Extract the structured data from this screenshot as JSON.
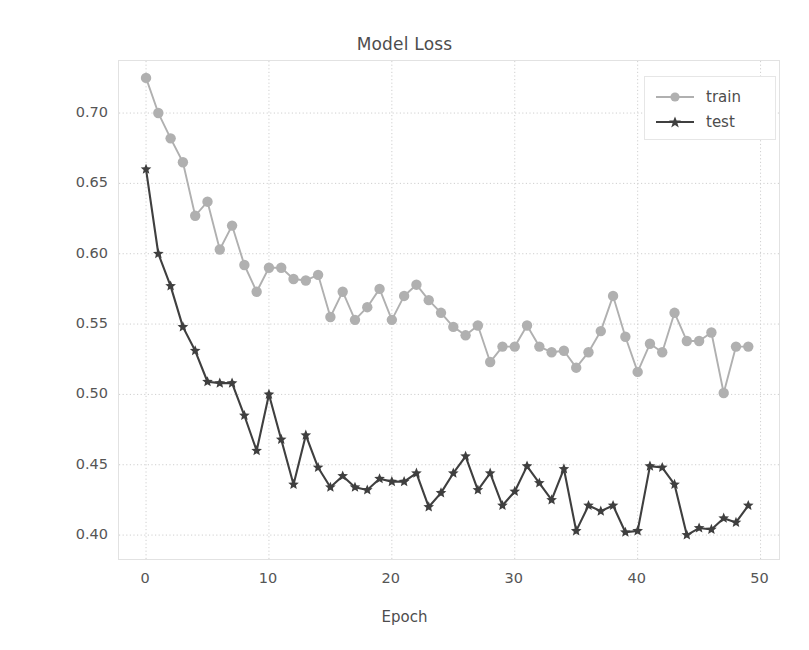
{
  "chart_data": {
    "type": "line",
    "title": "Model Loss",
    "xlabel": "Epoch",
    "ylabel": "Loss",
    "xlim": [
      -2.2,
      51.5
    ],
    "ylim": [
      0.383,
      0.737
    ],
    "grid": true,
    "legend_position": "upper right",
    "xticks": [
      0,
      10,
      20,
      30,
      40,
      50
    ],
    "xtick_labels": [
      "0",
      "10",
      "20",
      "30",
      "40",
      "50"
    ],
    "yticks": [
      0.4,
      0.45,
      0.5,
      0.55,
      0.6,
      0.65,
      0.7
    ],
    "ytick_labels": [
      "0.40",
      "0.45",
      "0.50",
      "0.55",
      "0.60",
      "0.65",
      "0.70"
    ],
    "x": [
      0,
      1,
      2,
      3,
      4,
      5,
      6,
      7,
      8,
      9,
      10,
      11,
      12,
      13,
      14,
      15,
      16,
      17,
      18,
      19,
      20,
      21,
      22,
      23,
      24,
      25,
      26,
      27,
      28,
      29,
      30,
      31,
      32,
      33,
      34,
      35,
      36,
      37,
      38,
      39,
      40,
      41,
      42,
      43,
      44,
      45,
      46,
      47,
      48,
      49
    ],
    "series": [
      {
        "name": "train",
        "color": "#b0b0b0",
        "marker": "circle",
        "values": [
          0.725,
          0.7,
          0.682,
          0.665,
          0.627,
          0.637,
          0.603,
          0.62,
          0.592,
          0.573,
          0.59,
          0.59,
          0.582,
          0.581,
          0.585,
          0.555,
          0.573,
          0.553,
          0.562,
          0.575,
          0.553,
          0.57,
          0.578,
          0.567,
          0.558,
          0.548,
          0.542,
          0.549,
          0.523,
          0.534,
          0.534,
          0.549,
          0.534,
          0.53,
          0.531,
          0.519,
          0.53,
          0.545,
          0.57,
          0.541,
          0.516,
          0.536,
          0.53,
          0.558,
          0.538,
          0.538,
          0.544,
          0.501,
          0.534,
          0.534
        ]
      },
      {
        "name": "test",
        "color": "#3f3f3f",
        "marker": "star",
        "values": [
          0.66,
          0.6,
          0.577,
          0.548,
          0.531,
          0.509,
          0.508,
          0.508,
          0.485,
          0.46,
          0.5,
          0.468,
          0.436,
          0.471,
          0.448,
          0.434,
          0.442,
          0.434,
          0.432,
          0.44,
          0.438,
          0.438,
          0.444,
          0.42,
          0.43,
          0.444,
          0.456,
          0.432,
          0.444,
          0.421,
          0.431,
          0.449,
          0.437,
          0.425,
          0.447,
          0.403,
          0.421,
          0.417,
          0.421,
          0.402,
          0.403,
          0.449,
          0.448,
          0.436,
          0.4,
          0.405,
          0.404,
          0.412,
          0.409,
          0.421
        ]
      }
    ]
  },
  "legend": {
    "entries": [
      {
        "label": "train"
      },
      {
        "label": "test"
      }
    ]
  }
}
